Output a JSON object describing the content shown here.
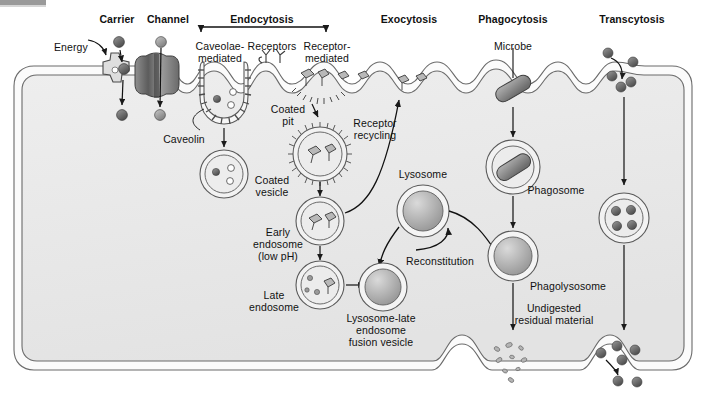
{
  "figure": {
    "title_bar_present": true,
    "background": "#ffffff",
    "cytoplasm_color": "#ebebeb",
    "membrane_color": "#f7f7f7",
    "stroke_color": "#555555",
    "particle_dark": "#4d4d4d",
    "particle_mid": "#8c8c8c"
  },
  "headers": [
    {
      "id": "carrier",
      "label": "Carrier",
      "x": 117,
      "y": 14
    },
    {
      "id": "channel",
      "label": "Channel",
      "x": 168,
      "y": 14
    },
    {
      "id": "endocytosis",
      "label": "Endocytosis",
      "x": 262,
      "y": 14
    },
    {
      "id": "exocytosis",
      "label": "Exocytosis",
      "x": 409,
      "y": 14
    },
    {
      "id": "phagocytosis",
      "label": "Phagocytosis",
      "x": 513,
      "y": 14
    },
    {
      "id": "transcytosis",
      "label": "Transcytosis",
      "x": 632,
      "y": 14
    }
  ],
  "labels": [
    {
      "id": "energy",
      "label": "Energy",
      "x": 54,
      "y": 42,
      "align": "left"
    },
    {
      "id": "caveolae-mediated",
      "label": "Caveolae-\nmediated",
      "x": 220,
      "y": 41,
      "align": "center"
    },
    {
      "id": "receptors",
      "label": "Receptors",
      "x": 272,
      "y": 41,
      "align": "center"
    },
    {
      "id": "receptor-mediated",
      "label": "Receptor-\nmediated",
      "x": 327,
      "y": 41,
      "align": "center"
    },
    {
      "id": "microbe",
      "label": "Microbe",
      "x": 513,
      "y": 41,
      "align": "center"
    },
    {
      "id": "caveolin",
      "label": "Caveolin",
      "x": 184,
      "y": 134,
      "align": "center"
    },
    {
      "id": "coated-pit",
      "label": "Coated\npit",
      "x": 288,
      "y": 104,
      "align": "center"
    },
    {
      "id": "coated-vesicle",
      "label": "Coated\nvesicle",
      "x": 272,
      "y": 175,
      "align": "center"
    },
    {
      "id": "receptor-recycling",
      "label": "Receptor\nrecycling",
      "x": 375,
      "y": 118,
      "align": "center"
    },
    {
      "id": "early-endosome",
      "label": "Early\nendosome\n(low pH)",
      "x": 278,
      "y": 227,
      "align": "center"
    },
    {
      "id": "late-endosome",
      "label": "Late\nendosome",
      "x": 274,
      "y": 290,
      "align": "center"
    },
    {
      "id": "lysosome",
      "label": "Lysosome",
      "x": 423,
      "y": 169,
      "align": "center"
    },
    {
      "id": "reconstitution",
      "label": "Reconstitution",
      "x": 440,
      "y": 256,
      "align": "center"
    },
    {
      "id": "fusion-vesicle",
      "label": "Lysosome-late\nendosome\nfusion vesicle",
      "x": 381,
      "y": 313,
      "align": "center"
    },
    {
      "id": "phagosome",
      "label": "Phagosome",
      "x": 556,
      "y": 185,
      "align": "center"
    },
    {
      "id": "phagolysosome",
      "label": "Phagolysosome",
      "x": 568,
      "y": 281,
      "align": "center"
    },
    {
      "id": "undigested-residual",
      "label": "Undigested\nresidual material",
      "x": 554,
      "y": 303,
      "align": "center"
    }
  ],
  "bracket": {
    "id": "endocytosis-bracket",
    "left_x": 201,
    "right_x": 326,
    "top_y": 26,
    "drop_y": 34
  },
  "structures": {
    "carrier_protein": "gear-shaped carrier protein embedded in membrane",
    "channel_protein": "barrel-shaped channel protein embedded in membrane",
    "caveola": "spiny caveolar pit with caveolin coat",
    "coated_pit": "clathrin coated pit with bound receptors",
    "membrane_shape": "rounded-rectangle cell with ruffled apical surface"
  }
}
